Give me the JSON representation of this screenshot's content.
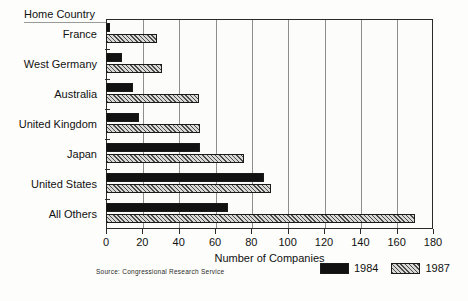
{
  "chart_data": {
    "type": "bar",
    "orientation": "horizontal",
    "title": "",
    "xlabel": "Number of Companies",
    "ylabel": "Home Country",
    "xlim": [
      0,
      180
    ],
    "xticks": [
      0,
      20,
      40,
      60,
      80,
      100,
      120,
      140,
      160,
      180
    ],
    "grid": true,
    "legend_position": "bottom-right",
    "categories": [
      "France",
      "West Germany",
      "Australia",
      "United Kingdom",
      "Japan",
      "United States",
      "All Others"
    ],
    "series": [
      {
        "name": "1984",
        "values": [
          2,
          9,
          15,
          18,
          52,
          87,
          67
        ]
      },
      {
        "name": "1987",
        "values": [
          28,
          31,
          51,
          52,
          76,
          91,
          170
        ]
      }
    ],
    "source": "Source:  Congressional Research Service",
    "colors": {
      "series_1984": "#111111",
      "series_1987": "#d8d8d4",
      "axis": "#2a2a2a",
      "grid": "#8d8d8d",
      "background": "#fdfdfb"
    }
  }
}
